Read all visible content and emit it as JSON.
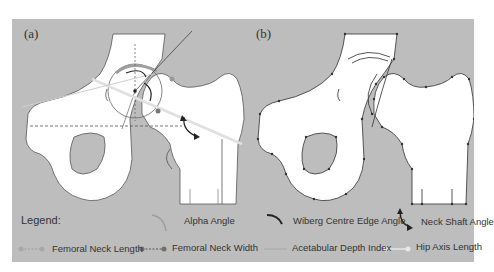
{
  "panels": {
    "a": {
      "label": "(a)"
    },
    "b": {
      "label": "(b)"
    }
  },
  "legend": {
    "title": "Legend:",
    "items": [
      {
        "label": "Alpha Angle",
        "symbol": "light-arc",
        "color": "#9e9e9e"
      },
      {
        "label": "Wiberg Centre Edge Angle",
        "symbol": "dark-arc",
        "color": "#222222"
      },
      {
        "label": "Neck Shaft Angle",
        "symbol": "double-arrow-curve",
        "color": "#222222"
      },
      {
        "label": "Femoral Neck Length",
        "symbol": "light-dotted-line-with-dots",
        "color": "#9e9e9e"
      },
      {
        "label": "Femoral Neck Width",
        "symbol": "dark-dotted-line-with-dots",
        "color": "#6f6f6f"
      },
      {
        "label": "Acetabular Depth Index",
        "symbol": "light-line",
        "color": "#a8a8a8"
      },
      {
        "label": "Hip Axis Length",
        "symbol": "white-line-with-dots",
        "color": "#e6e6e6"
      }
    ]
  },
  "colors": {
    "background": "#bdbdbd",
    "bone": "#ffffff",
    "outline": "#555555"
  }
}
